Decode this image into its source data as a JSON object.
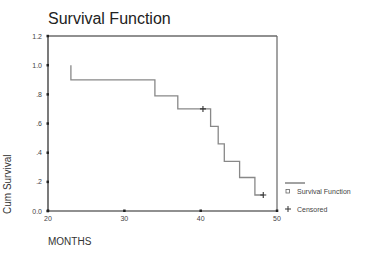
{
  "chart_data": {
    "type": "line",
    "subtype": "kaplan-meier-step",
    "title": "Survival Function",
    "xlabel": "MONTHS",
    "ylabel": "Cum Survival",
    "xlim": [
      20,
      50
    ],
    "ylim": [
      0.0,
      1.2
    ],
    "x_ticks": [
      "20",
      "30",
      "40",
      "50"
    ],
    "y_ticks": [
      "0.0",
      ".2",
      ".4",
      ".6",
      ".8",
      "1.0",
      "1.2"
    ],
    "grid": false,
    "legend_position": "right-bottom",
    "series": [
      {
        "name": "Survival Function",
        "steps": [
          {
            "x": 23,
            "y": 1.0
          },
          {
            "x": 23,
            "y": 0.9
          },
          {
            "x": 34,
            "y": 0.9
          },
          {
            "x": 34,
            "y": 0.79
          },
          {
            "x": 37,
            "y": 0.79
          },
          {
            "x": 37,
            "y": 0.7
          },
          {
            "x": 41.3,
            "y": 0.7
          },
          {
            "x": 41.3,
            "y": 0.58
          },
          {
            "x": 42.3,
            "y": 0.58
          },
          {
            "x": 42.3,
            "y": 0.46
          },
          {
            "x": 43.1,
            "y": 0.46
          },
          {
            "x": 43.1,
            "y": 0.34
          },
          {
            "x": 45.1,
            "y": 0.34
          },
          {
            "x": 45.1,
            "y": 0.23
          },
          {
            "x": 47.1,
            "y": 0.23
          },
          {
            "x": 47.1,
            "y": 0.11
          },
          {
            "x": 48.2,
            "y": 0.11
          }
        ]
      },
      {
        "name": "Censored",
        "points": [
          {
            "x": 40.3,
            "y": 0.7
          },
          {
            "x": 48.2,
            "y": 0.11
          }
        ]
      }
    ]
  },
  "legend": {
    "items": [
      {
        "label": "Survival Function",
        "symbol": "square"
      },
      {
        "label": "Censored",
        "symbol": "plus"
      }
    ]
  },
  "colors": {
    "line": "#888888",
    "axis": "#222222"
  }
}
